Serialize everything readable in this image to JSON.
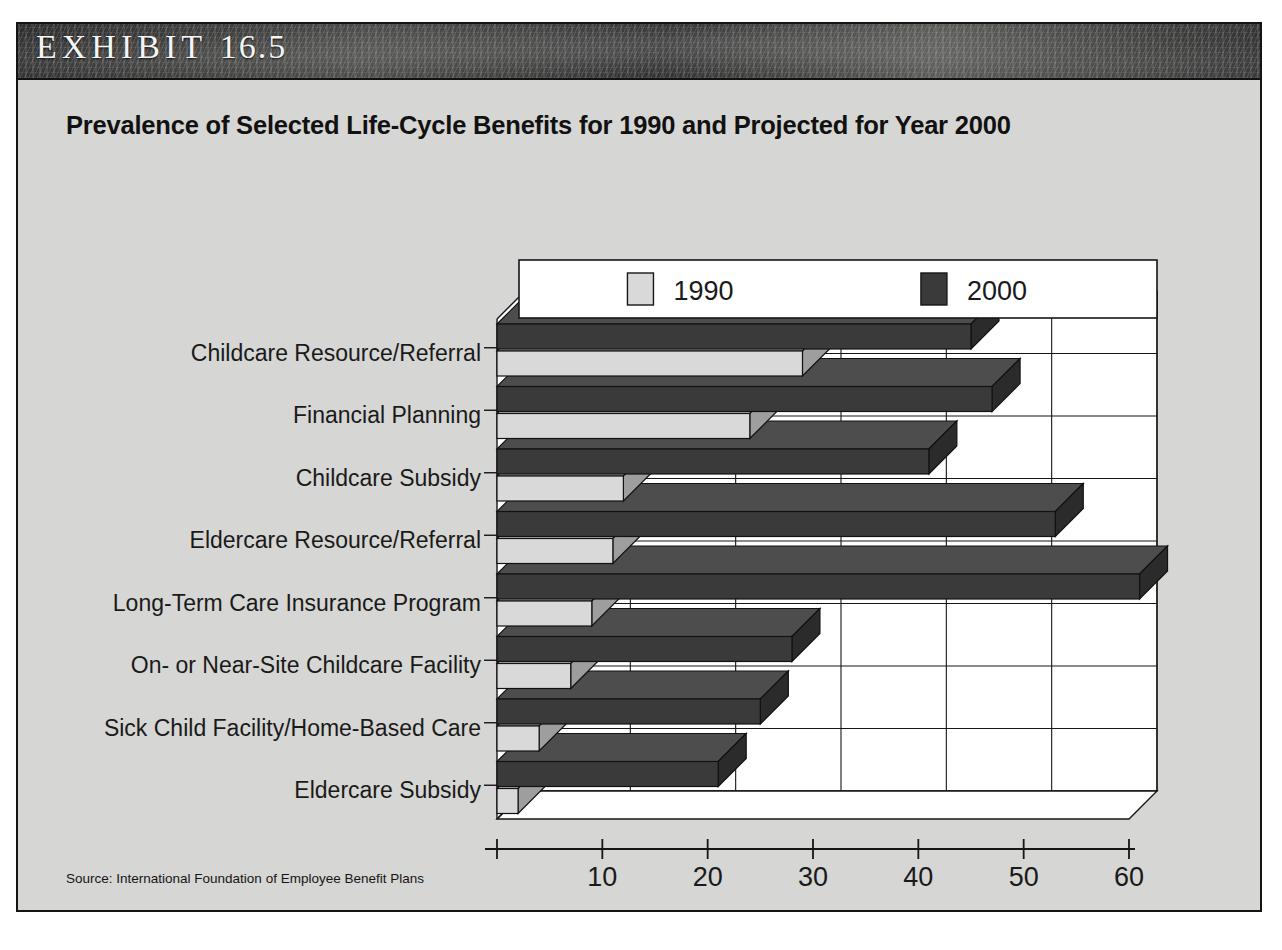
{
  "exhibit": {
    "label_word": "EXHIBIT",
    "number": "16.5"
  },
  "title": "Prevalence of Selected Life-Cycle Benefits for 1990 and Projected for Year 2000",
  "source": "Source: International Foundation of Employee Benefit Plans",
  "legend": {
    "entries": [
      {
        "label": "1990",
        "color": "#d9d9d9"
      },
      {
        "label": "2000",
        "color": "#3a3a3a"
      }
    ]
  },
  "axis": {
    "x_title": "Percent of Responding Companies",
    "x_ticks": [
      "10",
      "20",
      "30",
      "40",
      "50",
      "60"
    ],
    "x_min": 0,
    "x_max": 60
  },
  "colors": {
    "panel_background": "#d6d6d4",
    "plot_background": "#ffffff",
    "border": "#141414",
    "series_1990": "#d9d9d9",
    "series_2000": "#3a3a3a",
    "header_band": "#3b3b3b"
  },
  "chart_data": {
    "type": "bar",
    "orientation": "horizontal",
    "title": "Prevalence of Selected Life-Cycle Benefits for 1990 and Projected for Year 2000",
    "xlabel": "Percent of Responding Companies",
    "ylabel": "",
    "xlim": [
      0,
      60
    ],
    "grid": true,
    "legend_position": "top",
    "categories": [
      "Childcare Resource/Referral",
      "Financial Planning",
      "Childcare Subsidy",
      "Eldercare Resource/Referral",
      "Long-Term Care Insurance Program",
      "On- or Near-Site Childcare Facility",
      "Sick Child Facility/Home-Based Care",
      "Eldercare Subsidy"
    ],
    "series": [
      {
        "name": "1990",
        "color": "#d9d9d9",
        "values": [
          29,
          24,
          12,
          11,
          9,
          7,
          4,
          2
        ]
      },
      {
        "name": "2000",
        "color": "#3a3a3a",
        "values": [
          45,
          47,
          41,
          53,
          61,
          28,
          25,
          21
        ]
      }
    ]
  }
}
